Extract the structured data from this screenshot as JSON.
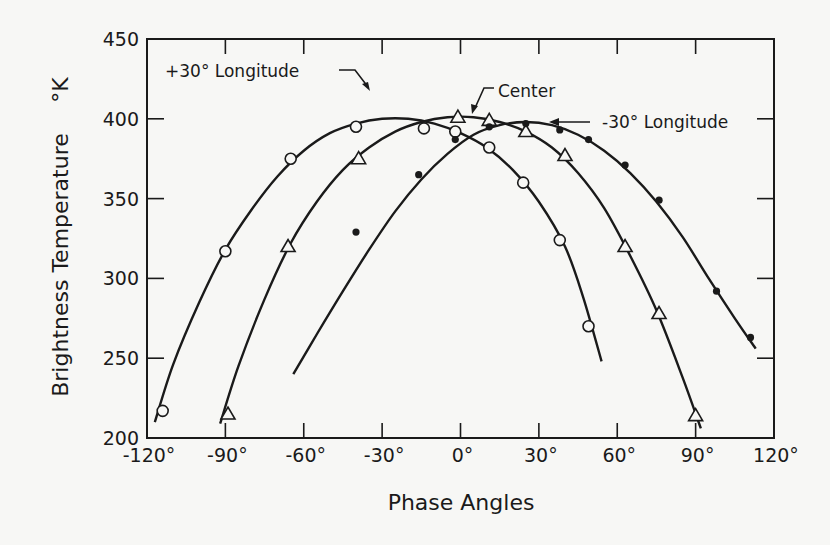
{
  "chart_data": {
    "type": "scatter",
    "title": "",
    "xlabel": "Phase Angles",
    "ylabel": "Brightness Temperature °K",
    "xlim": [
      -120,
      120
    ],
    "ylim": [
      200,
      450
    ],
    "x_ticks": [
      -120,
      -90,
      -60,
      -30,
      0,
      30,
      60,
      90,
      120
    ],
    "x_tick_labels": [
      "-120°",
      "-90°",
      "-60°",
      "-30°",
      "0°",
      "30°",
      "60°",
      "90°",
      "120°"
    ],
    "y_ticks": [
      200,
      250,
      300,
      350,
      400,
      450
    ],
    "y_tick_labels": [
      "200",
      "250",
      "300",
      "350",
      "400",
      "450"
    ],
    "grid": false,
    "legend": "annotations on curves",
    "series": [
      {
        "name": "+30° Longitude",
        "marker": "open-circle",
        "points": [
          [
            -114,
            217
          ],
          [
            -90,
            317
          ],
          [
            -65,
            375
          ],
          [
            -40,
            395
          ],
          [
            -14,
            394
          ],
          [
            -2,
            392
          ],
          [
            11,
            382
          ],
          [
            24,
            360
          ],
          [
            38,
            324
          ],
          [
            49,
            270
          ]
        ],
        "curve": [
          [
            -117,
            210
          ],
          [
            -110,
            246
          ],
          [
            -100,
            285
          ],
          [
            -90,
            318
          ],
          [
            -80,
            343
          ],
          [
            -70,
            364
          ],
          [
            -60,
            380
          ],
          [
            -50,
            391
          ],
          [
            -40,
            397
          ],
          [
            -30,
            400
          ],
          [
            -20,
            400
          ],
          [
            -10,
            397
          ],
          [
            0,
            391
          ],
          [
            10,
            382
          ],
          [
            20,
            368
          ],
          [
            30,
            348
          ],
          [
            40,
            320
          ],
          [
            47,
            288
          ],
          [
            54,
            248
          ]
        ]
      },
      {
        "name": "Center",
        "marker": "open-triangle",
        "points": [
          [
            -89,
            215
          ],
          [
            -66,
            320
          ],
          [
            -39,
            375
          ],
          [
            -1,
            401
          ],
          [
            11,
            399
          ],
          [
            25,
            392
          ],
          [
            40,
            377
          ],
          [
            63,
            320
          ],
          [
            76,
            278
          ],
          [
            90,
            214
          ]
        ],
        "curve": [
          [
            -92,
            209
          ],
          [
            -85,
            245
          ],
          [
            -75,
            287
          ],
          [
            -65,
            322
          ],
          [
            -55,
            348
          ],
          [
            -45,
            368
          ],
          [
            -35,
            382
          ],
          [
            -25,
            392
          ],
          [
            -15,
            398
          ],
          [
            -5,
            401
          ],
          [
            5,
            401
          ],
          [
            15,
            398
          ],
          [
            25,
            392
          ],
          [
            35,
            382
          ],
          [
            45,
            366
          ],
          [
            55,
            344
          ],
          [
            65,
            314
          ],
          [
            75,
            280
          ],
          [
            85,
            238
          ],
          [
            92,
            206
          ]
        ]
      },
      {
        "name": "-30° Longitude",
        "marker": "filled-dot",
        "points": [
          [
            -40,
            329
          ],
          [
            -16,
            365
          ],
          [
            -2,
            387
          ],
          [
            11,
            395
          ],
          [
            25,
            397
          ],
          [
            38,
            393
          ],
          [
            49,
            387
          ],
          [
            63,
            371
          ],
          [
            76,
            349
          ],
          [
            98,
            292
          ],
          [
            111,
            263
          ]
        ],
        "curve": [
          [
            -64,
            240
          ],
          [
            -55,
            265
          ],
          [
            -45,
            292
          ],
          [
            -35,
            318
          ],
          [
            -25,
            342
          ],
          [
            -15,
            362
          ],
          [
            -5,
            378
          ],
          [
            5,
            390
          ],
          [
            15,
            396
          ],
          [
            25,
            398
          ],
          [
            35,
            396
          ],
          [
            45,
            390
          ],
          [
            55,
            380
          ],
          [
            65,
            366
          ],
          [
            75,
            348
          ],
          [
            85,
            326
          ],
          [
            95,
            300
          ],
          [
            105,
            275
          ],
          [
            113,
            256
          ]
        ]
      }
    ],
    "annotations": [
      {
        "text": "+30° Longitude",
        "x": -118,
        "y": 415,
        "arrow_to": [
          -27,
          400
        ]
      },
      {
        "text": "Center",
        "x": 22,
        "y": 418,
        "arrow_to": [
          7,
          402
        ]
      },
      {
        "text": "-30° Longitude",
        "x": 60,
        "y": 395,
        "arrow_to": [
          36,
          397
        ]
      }
    ]
  },
  "labels": {
    "xlabel": "Phase Angles",
    "ylabel": "Brightness Temperature",
    "ylabel_unit": "°K",
    "annot_plus30": "+30° Longitude",
    "annot_center": "Center",
    "annot_minus30": "-30° Longitude"
  },
  "colors": {
    "ink": "#1a1a1a",
    "background": "#f7f7f5"
  }
}
